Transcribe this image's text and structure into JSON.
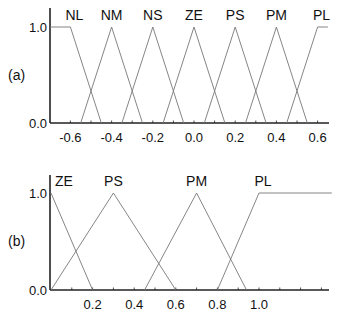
{
  "chart_data": [
    {
      "type": "line",
      "panel_label": "(a)",
      "title": "",
      "xlabel": "",
      "ylabel": "",
      "xlim": [
        -0.72,
        0.65
      ],
      "ylim": [
        0.0,
        1.2
      ],
      "x_ticks": [
        "-0.6",
        "-0.4",
        "-0.2",
        "0.0",
        "0.2",
        "0.4",
        "0.6"
      ],
      "x_tick_values": [
        -0.6,
        -0.4,
        -0.2,
        0.0,
        0.2,
        0.4,
        0.6
      ],
      "y_ticks": [
        "0.0",
        "1.0"
      ],
      "series": [
        {
          "name": "NL",
          "points": [
            [
              -0.72,
              1.0
            ],
            [
              -0.6,
              1.0
            ],
            [
              -0.45,
              0.0
            ]
          ]
        },
        {
          "name": "NM",
          "points": [
            [
              -0.55,
              0.0
            ],
            [
              -0.4,
              1.0
            ],
            [
              -0.25,
              0.0
            ]
          ]
        },
        {
          "name": "NS",
          "points": [
            [
              -0.35,
              0.0
            ],
            [
              -0.2,
              1.0
            ],
            [
              -0.05,
              0.0
            ]
          ]
        },
        {
          "name": "ZE",
          "points": [
            [
              -0.15,
              0.0
            ],
            [
              0.0,
              1.0
            ],
            [
              0.15,
              0.0
            ]
          ]
        },
        {
          "name": "PS",
          "points": [
            [
              0.05,
              0.0
            ],
            [
              0.2,
              1.0
            ],
            [
              0.35,
              0.0
            ]
          ]
        },
        {
          "name": "PM",
          "points": [
            [
              0.25,
              0.0
            ],
            [
              0.4,
              1.0
            ],
            [
              0.55,
              0.0
            ]
          ]
        },
        {
          "name": "PL",
          "points": [
            [
              0.45,
              0.0
            ],
            [
              0.6,
              1.0
            ],
            [
              0.65,
              1.0
            ]
          ]
        }
      ]
    },
    {
      "type": "line",
      "panel_label": "(b)",
      "title": "",
      "xlabel": "",
      "ylabel": "",
      "xlim": [
        0.0,
        1.35
      ],
      "ylim": [
        0.0,
        1.2
      ],
      "x_ticks": [
        "0.2",
        "0.4",
        "0.6",
        "0.8",
        "1.0"
      ],
      "x_tick_values": [
        0.2,
        0.4,
        0.6,
        0.8,
        1.0
      ],
      "y_ticks": [
        "0.0",
        "1.0"
      ],
      "series": [
        {
          "name": "ZE",
          "points": [
            [
              0.0,
              1.0
            ],
            [
              0.2,
              0.0
            ]
          ]
        },
        {
          "name": "PS",
          "points": [
            [
              0.0,
              0.0
            ],
            [
              0.3,
              1.0
            ],
            [
              0.6,
              0.0
            ]
          ]
        },
        {
          "name": "PM",
          "points": [
            [
              0.45,
              0.0
            ],
            [
              0.7,
              1.0
            ],
            [
              0.94,
              0.0
            ]
          ]
        },
        {
          "name": "PL",
          "points": [
            [
              0.8,
              0.0
            ],
            [
              1.0,
              1.0
            ],
            [
              1.35,
              1.0
            ]
          ]
        }
      ]
    }
  ],
  "colors": {
    "axis": "#222222",
    "membership_line": "#777777",
    "text": "#111111"
  }
}
